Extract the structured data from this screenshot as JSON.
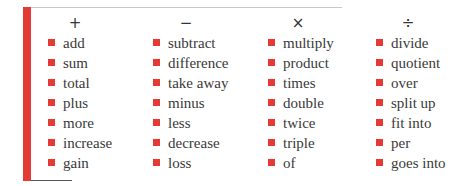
{
  "accent_color": "#e53935",
  "columns": [
    {
      "symbol": "+",
      "operation": "addition",
      "terms": [
        "add",
        "sum",
        "total",
        "plus",
        "more",
        "increase",
        "gain"
      ]
    },
    {
      "symbol": "−",
      "operation": "subtraction",
      "terms": [
        "subtract",
        "difference",
        "take away",
        "minus",
        "less",
        "decrease",
        "loss"
      ]
    },
    {
      "symbol": "×",
      "operation": "multiplication",
      "terms": [
        "multiply",
        "product",
        "times",
        "double",
        "twice",
        "triple",
        "of"
      ]
    },
    {
      "symbol": "÷",
      "operation": "division",
      "terms": [
        "divide",
        "quotient",
        "over",
        "split up",
        "fit into",
        "per",
        "goes into"
      ]
    }
  ]
}
